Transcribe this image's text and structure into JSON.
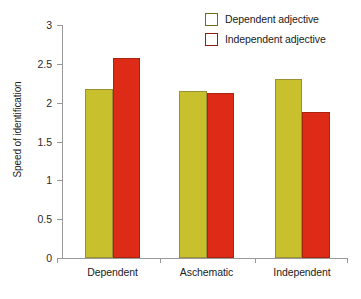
{
  "chart_data": {
    "type": "bar",
    "title": "",
    "subtitle": "",
    "xlabel": "",
    "ylabel": "Speed of identification",
    "categories": [
      "Dependent",
      "Aschematic",
      "Independent"
    ],
    "series": [
      {
        "name": "Dependent adjective",
        "color": "#c9c02e",
        "values": [
          2.18,
          2.15,
          2.3
        ]
      },
      {
        "name": "Independent adjective",
        "color": "#dd2b18",
        "values": [
          2.58,
          2.12,
          1.88
        ]
      }
    ],
    "ylim": [
      0,
      3
    ],
    "ytick_labels": [
      "0",
      "0.5",
      "1",
      "1.5",
      "2",
      "2.5",
      "3"
    ],
    "ytick_values": [
      0,
      0.5,
      1,
      1.5,
      2,
      2.5,
      3
    ],
    "grid": false,
    "legend_position": "top-right",
    "axis_color": "#9a9a9a",
    "background": "#ffffff"
  },
  "legend": {
    "items": [
      {
        "label": "Dependent adjective",
        "color": "#c9c02e"
      },
      {
        "label": "Independent adjective",
        "color": "#dd2b18"
      }
    ]
  },
  "axes": {
    "y_title": "Speed of identification"
  }
}
